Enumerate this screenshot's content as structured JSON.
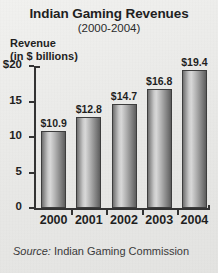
{
  "chart_data": {
    "type": "bar",
    "title": "Indian Gaming Revenues",
    "subtitle": "(2000-2004)",
    "ylabel_line1": "Revenue",
    "ylabel_line2": "(in $ billions)",
    "xlabel": "",
    "categories": [
      "2000",
      "2001",
      "2002",
      "2003",
      "2004"
    ],
    "values": [
      10.9,
      12.8,
      14.7,
      16.8,
      19.4
    ],
    "value_labels": [
      "$10.9",
      "$12.8",
      "$14.7",
      "$16.8",
      "$19.4"
    ],
    "ylim": [
      0,
      20
    ],
    "yticks": [
      0,
      5,
      10,
      15,
      20
    ],
    "ytick_labels": [
      "0",
      "5",
      "10",
      "15",
      "$20"
    ],
    "grid": false,
    "legend": null,
    "source_lead": "Source:",
    "source_text": "Indian Gaming Commission",
    "colors": {
      "background": "#ebebe9",
      "bar_light": "#d8d8d8",
      "bar_dark": "#5d5d5d",
      "axis": "#333333",
      "text": "#1f1f1f"
    }
  }
}
